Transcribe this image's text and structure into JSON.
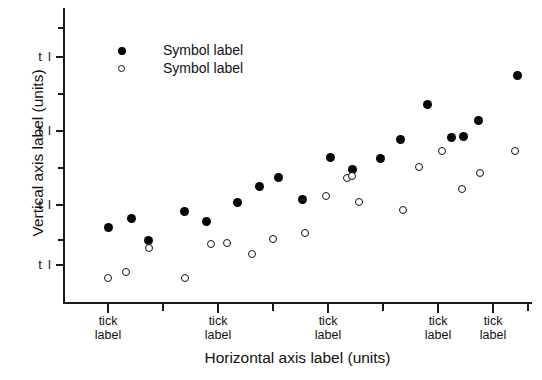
{
  "chart_data": {
    "type": "scatter",
    "title": "",
    "xlabel": "Horizontal axis label (units)",
    "ylabel": "Vertical axis label (units)",
    "grid": false,
    "legend_position": "upper-left-inside",
    "x_tick_labels": [
      "tick label",
      "tick label",
      "tick label",
      "tick label",
      "tick label"
    ],
    "x_tick_label_line1": "tick",
    "x_tick_label_line2": "label",
    "y_tick_labels": [
      "t l",
      "t l",
      "t l",
      "t l"
    ],
    "xlim": [
      0,
      100
    ],
    "ylim": [
      0,
      100
    ],
    "series": [
      {
        "name": "Symbol label",
        "marker": "filled-circle",
        "color": "#050505",
        "points": [
          {
            "x": 9.8,
            "y": 25.5
          },
          {
            "x": 14.6,
            "y": 28.4
          },
          {
            "x": 18.2,
            "y": 21.0
          },
          {
            "x": 25.8,
            "y": 30.7
          },
          {
            "x": 30.5,
            "y": 27.4
          },
          {
            "x": 37.3,
            "y": 33.9
          },
          {
            "x": 41.8,
            "y": 39.3
          },
          {
            "x": 45.9,
            "y": 42.5
          },
          {
            "x": 51.0,
            "y": 35.0
          },
          {
            "x": 57.0,
            "y": 49.0
          },
          {
            "x": 61.7,
            "y": 45.2
          },
          {
            "x": 67.7,
            "y": 48.9
          },
          {
            "x": 71.9,
            "y": 55.3
          },
          {
            "x": 77.8,
            "y": 67.1
          },
          {
            "x": 82.8,
            "y": 56.0
          },
          {
            "x": 85.4,
            "y": 56.4
          },
          {
            "x": 88.6,
            "y": 61.8
          },
          {
            "x": 97.0,
            "y": 77.0
          }
        ]
      },
      {
        "name": "Symbol label",
        "marker": "open-circle",
        "color": "#ffffff",
        "points": [
          {
            "x": 9.5,
            "y": 8.2
          },
          {
            "x": 13.5,
            "y": 10.1
          },
          {
            "x": 18.3,
            "y": 18.5
          },
          {
            "x": 26.0,
            "y": 8.1
          },
          {
            "x": 31.5,
            "y": 19.6
          },
          {
            "x": 35.0,
            "y": 19.9
          },
          {
            "x": 40.3,
            "y": 16.2
          },
          {
            "x": 44.8,
            "y": 21.5
          },
          {
            "x": 51.5,
            "y": 23.5
          },
          {
            "x": 56.0,
            "y": 36.0
          },
          {
            "x": 60.6,
            "y": 42.3
          },
          {
            "x": 61.6,
            "y": 43.0
          },
          {
            "x": 63.1,
            "y": 33.9
          },
          {
            "x": 72.5,
            "y": 31.2
          },
          {
            "x": 76.0,
            "y": 45.8
          },
          {
            "x": 80.8,
            "y": 51.5
          },
          {
            "x": 85.0,
            "y": 38.5
          },
          {
            "x": 88.9,
            "y": 43.8
          },
          {
            "x": 96.4,
            "y": 51.4
          }
        ]
      }
    ]
  },
  "axes": {
    "y_ticks_px": [
      28,
      57,
      94,
      131,
      168,
      205,
      240,
      265
    ],
    "y_label_ticks_px": [
      57,
      131,
      205,
      265
    ],
    "x_ticks_px": [
      108,
      163,
      218,
      273,
      328,
      383,
      438,
      493,
      528
    ],
    "x_label_ticks_px": [
      108,
      218,
      328,
      438,
      493
    ]
  },
  "legend": {
    "items": [
      {
        "label": "Symbol label",
        "marker": "filled-circle"
      },
      {
        "label": "Symbol label",
        "marker": "open-circle"
      }
    ]
  }
}
